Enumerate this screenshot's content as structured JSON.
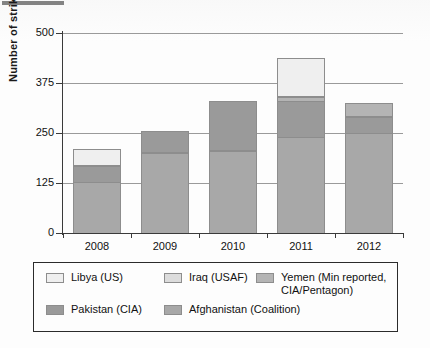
{
  "chart_data": {
    "type": "bar",
    "subtype": "stacked-bar",
    "title": "",
    "xlabel": "",
    "ylabel": "Number of strikes",
    "categories": [
      "2008",
      "2009",
      "2010",
      "2011",
      "2012"
    ],
    "ylim": [
      0,
      500
    ],
    "yticks": [
      0,
      125,
      250,
      375,
      500
    ],
    "ytick_labels": [
      "0",
      "125",
      "250",
      "375",
      "500"
    ],
    "grid": true,
    "grid_axis": "y",
    "legend_position": "bottom",
    "series": [
      {
        "name": "Afghanistan (Coalition)",
        "color": "#a8a8a8",
        "values": [
          128,
          200,
          205,
          240,
          250
        ]
      },
      {
        "name": "Pakistan (CIA)",
        "color": "#9a9a9a",
        "values": [
          39,
          55,
          125,
          90,
          40
        ]
      },
      {
        "name": "Yemen (Min reported, CIA/Pentagon)",
        "color": "#b4b4b4",
        "values": [
          0,
          0,
          0,
          10,
          35
        ]
      },
      {
        "name": "Iraq (USAF)",
        "color": "#dcdcdc",
        "values": [
          0,
          0,
          0,
          0,
          0
        ]
      },
      {
        "name": "Libya (US)",
        "color": "#efefef",
        "values": [
          43,
          0,
          0,
          97,
          0
        ]
      }
    ],
    "totals": [
      210,
      255,
      330,
      437,
      325
    ]
  },
  "legend": {
    "entries": [
      {
        "label": "Libya (US)",
        "color": "#efefef"
      },
      {
        "label": "Iraq (USAF)",
        "color": "#dcdcdc"
      },
      {
        "label": "Yemen (Min reported,\nCIA/Pentagon)",
        "color": "#b4b4b4"
      },
      {
        "label": "Pakistan (CIA)",
        "color": "#9a9a9a"
      },
      {
        "label": "Afghanistan (Coalition)",
        "color": "#a8a8a8"
      }
    ]
  },
  "colors": {
    "axis": "#3a3a3a",
    "grid": "#9a9a9a",
    "bar_outline": "#8d8d8d",
    "background": "#fdfdfd"
  }
}
